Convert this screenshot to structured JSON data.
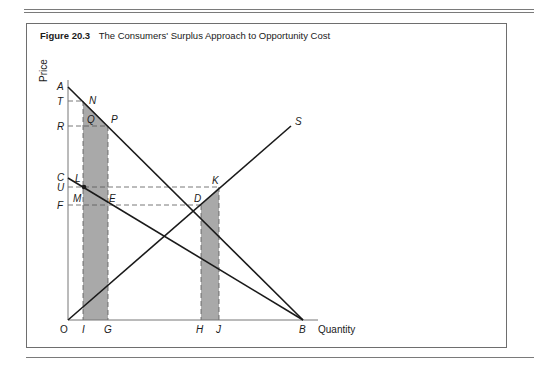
{
  "figure": {
    "number": "Figure 20.3",
    "title": "The Consumers' Surplus Approach to Opportunity Cost"
  },
  "axes": {
    "y_label": "Price",
    "x_label": "Quantity",
    "origin_label": "O"
  },
  "price_labels": {
    "A": "A",
    "T": "T",
    "R": "R",
    "C": "C",
    "U": "U",
    "F": "F"
  },
  "quantity_labels": {
    "I": "I",
    "G": "G",
    "H": "H",
    "J": "J",
    "B": "B"
  },
  "point_labels": {
    "N": "N",
    "P": "P",
    "Q": "Q",
    "L": "L",
    "M": "M",
    "E": "E",
    "D": "D",
    "K": "K",
    "S": "S"
  },
  "curves": [
    {
      "name": "demand-AB",
      "from": "A",
      "to": "B"
    },
    {
      "name": "demand-CB",
      "from": "C",
      "to": "B"
    },
    {
      "name": "supply-OS",
      "from": "O",
      "to": "S"
    }
  ],
  "shaded_regions": [
    {
      "name": "left-band",
      "between": [
        "I",
        "G"
      ]
    },
    {
      "name": "right-band",
      "between": [
        "H",
        "J"
      ]
    }
  ],
  "colors": {
    "shade": "#a9a9a9",
    "line": "#1a1a1a",
    "dash": "#555555"
  }
}
